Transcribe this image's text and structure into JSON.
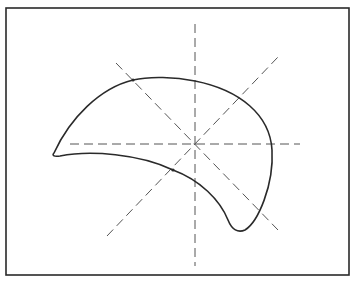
{
  "diagram": {
    "type": "geometric-figure",
    "colors": {
      "background": "#ffffff",
      "stroke": "#2a2a2a",
      "dash": "#555555"
    },
    "frame": {
      "x": 6,
      "y": 8,
      "width": 343,
      "height": 267
    },
    "center": {
      "x": 195,
      "y": 144
    },
    "axes": [
      {
        "name": "horizontal",
        "x1": 70,
        "y1": 144,
        "x2": 300,
        "y2": 144
      },
      {
        "name": "vertical",
        "x1": 195,
        "y1": 24,
        "x2": 195,
        "y2": 266
      },
      {
        "name": "diagonal-down",
        "x1": 116,
        "y1": 63,
        "x2": 278,
        "y2": 230
      },
      {
        "name": "diagonal-up",
        "x1": 107,
        "y1": 236,
        "x2": 278,
        "y2": 57
      }
    ],
    "marked_points": [
      {
        "x": 133,
        "y": 80
      },
      {
        "x": 173,
        "y": 170
      }
    ]
  }
}
